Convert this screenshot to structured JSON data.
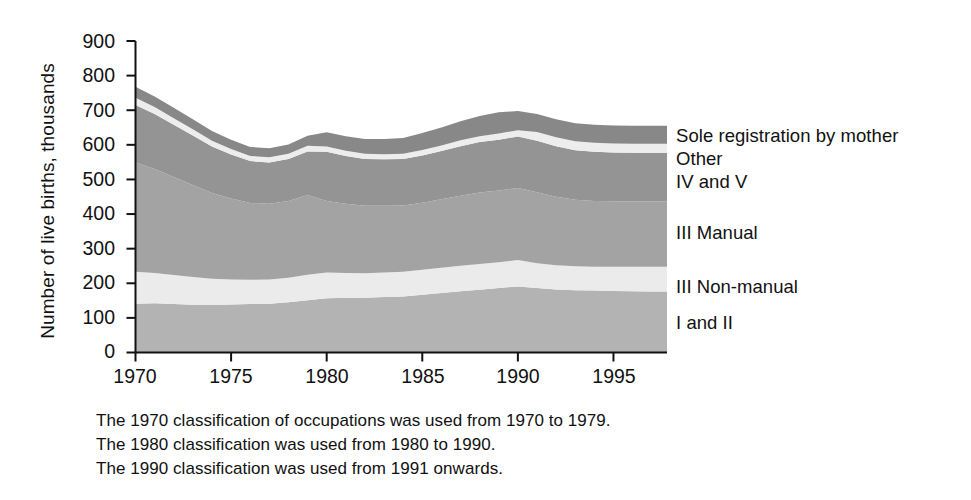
{
  "chart_data": {
    "type": "area",
    "stacked": true,
    "title": "",
    "xlabel": "",
    "ylabel": "Number of live births, thousands",
    "xlim": [
      1970,
      1997.8
    ],
    "ylim": [
      0,
      900
    ],
    "ytick_labels": [
      "0",
      "100",
      "200",
      "300",
      "400",
      "500",
      "600",
      "700",
      "800",
      "900"
    ],
    "yticks": [
      0,
      100,
      200,
      300,
      400,
      500,
      600,
      700,
      800,
      900
    ],
    "xtick_labels": [
      "1970",
      "1975",
      "1980",
      "1985",
      "1990",
      "1995"
    ],
    "xticks": [
      1970,
      1975,
      1980,
      1985,
      1990,
      1995
    ],
    "grid": false,
    "legend_position": "right-inline",
    "x": [
      1970,
      1971,
      1972,
      1973,
      1974,
      1975,
      1976,
      1977,
      1978,
      1979,
      1980,
      1981,
      1982,
      1983,
      1984,
      1985,
      1986,
      1987,
      1988,
      1989,
      1990,
      1991,
      1992,
      1993,
      1994,
      1995,
      1996,
      1997
    ],
    "series": [
      {
        "name": "I and II",
        "color": "#b3b3b3",
        "values": [
          141,
          142,
          140,
          138,
          137,
          139,
          140,
          141,
          145,
          151,
          157,
          158,
          158,
          160,
          162,
          167,
          172,
          177,
          181,
          186,
          191,
          186,
          182,
          180,
          179,
          178,
          177,
          176
        ]
      },
      {
        "name": "III Non-manual",
        "color": "#ebebeb",
        "values": [
          92,
          88,
          84,
          80,
          76,
          72,
          70,
          70,
          71,
          74,
          74,
          72,
          71,
          71,
          71,
          72,
          73,
          74,
          75,
          75,
          76,
          72,
          70,
          69,
          69,
          70,
          71,
          72
        ]
      },
      {
        "name": "III Manual",
        "color": "#a3a3a3",
        "values": [
          316,
          300,
          283,
          266,
          248,
          234,
          222,
          219,
          222,
          230,
          207,
          200,
          195,
          193,
          192,
          194,
          198,
          202,
          206,
          207,
          208,
          205,
          198,
          192,
          190,
          189,
          188,
          188
        ]
      },
      {
        "name": "IV and V",
        "color": "#949494",
        "values": [
          166,
          159,
          151,
          143,
          134,
          127,
          121,
          119,
          121,
          126,
          142,
          138,
          135,
          134,
          134,
          136,
          139,
          143,
          146,
          147,
          149,
          149,
          146,
          143,
          142,
          141,
          141,
          141
        ]
      },
      {
        "name": "Other",
        "color": "#ededed",
        "values": [
          21,
          20,
          19,
          18,
          17,
          16,
          15,
          15,
          15,
          16,
          15,
          15,
          15,
          15,
          15,
          16,
          16,
          17,
          17,
          18,
          18,
          25,
          26,
          26,
          26,
          26,
          26,
          26
        ]
      },
      {
        "name": "Sole registration by mother",
        "color": "#888888",
        "values": [
          32,
          31,
          30,
          29,
          28,
          27,
          26,
          26,
          27,
          29,
          41,
          42,
          43,
          44,
          46,
          49,
          52,
          55,
          58,
          61,
          56,
          52,
          52,
          52,
          52,
          52,
          52,
          52
        ]
      }
    ],
    "legend_labels": [
      "Sole registration by mother",
      "Other",
      "IV and V",
      "III Manual",
      "III Non-manual",
      "I and II"
    ],
    "notes": [
      "The 1970 classification of occupations was used from 1970 to 1979.",
      "The 1980 classification was used from 1980 to 1990.",
      "The 1990 classification was used from 1991 onwards."
    ]
  }
}
